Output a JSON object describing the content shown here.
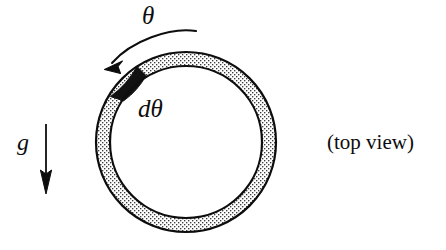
{
  "figure": {
    "type": "physics-diagram",
    "background_color": "#ffffff",
    "ink_color": "#0d0d0d",
    "ring": {
      "name": "circular-ring-annulus",
      "center_x": 186,
      "center_y": 142,
      "outer_radius": 90,
      "inner_radius": 76,
      "outline_color": "#0d0d0d",
      "outline_width": 2.2,
      "fill_pattern": "stipple-dots",
      "fill_dot_color": "#3a3a3a",
      "fill_background": "#ffffff"
    },
    "mass_element": {
      "name": "mass-element-segment",
      "fill_color": "#111111",
      "start_angle_deg": 123,
      "end_angle_deg": 147,
      "description": "solid black wedge of the annulus marking the differential mass element"
    },
    "rotation_arrow": {
      "name": "rotation-direction-arrow",
      "description": "curved arrow above the ring indicating the sense of increasing theta (counter-clockwise toward upper-left)",
      "tail_x": 196,
      "tail_y": 31,
      "tip_x": 105,
      "tip_y": 68,
      "color": "#0d0d0d"
    },
    "gravity_arrow": {
      "name": "gravity-direction-arrow",
      "description": "straight vertical arrow pointing down, labelled g",
      "x": 46,
      "top_y": 124,
      "bottom_y": 192,
      "color": "#0d0d0d"
    }
  },
  "labels": {
    "theta": "θ",
    "d_theta": "dθ",
    "gravity": "g",
    "view_caption": "(top view)"
  }
}
